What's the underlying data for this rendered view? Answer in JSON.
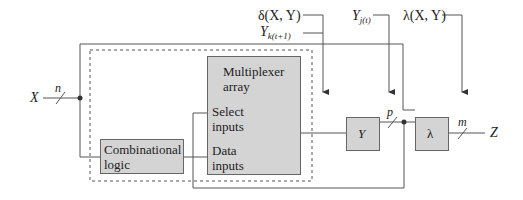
{
  "diagram": {
    "type": "sequential-machine-block-diagram",
    "inputs": {
      "x_label": "X",
      "x_bus_width": "n"
    },
    "outputs": {
      "z_label": "Z",
      "z_bus_width": "m"
    },
    "signals": {
      "delta_label": "δ(X, Y)",
      "yk_label": "Y",
      "yk_sub": "k(t+1)",
      "yj_label": "Y",
      "yj_sub": "j(t)",
      "lambda_fn_label": "λ(X, Y)",
      "p_bus_width": "p"
    },
    "blocks": {
      "mux_title_1": "Multiplexer",
      "mux_title_2": "array",
      "mux_select_1": "Select",
      "mux_select_2": "inputs",
      "mux_data_1": "Data",
      "mux_data_2": "inputs",
      "comb_1": "Combinational",
      "comb_2": "logic",
      "state_register": "Y",
      "output_logic": "λ"
    },
    "colors": {
      "block_fill": "#d4d4d4",
      "line": "#555555",
      "text": "#222222"
    }
  }
}
